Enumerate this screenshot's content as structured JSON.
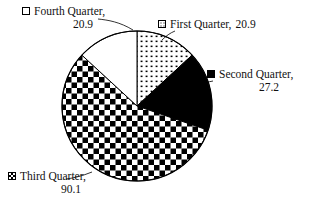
{
  "chart_data": {
    "type": "pie",
    "title": "",
    "categories": [
      "First Quarter",
      "Second Quarter",
      "Third Quarter",
      "Fourth Quarter"
    ],
    "values": [
      20.9,
      27.2,
      90.1,
      20.9
    ],
    "total": 159.1,
    "start_angle_deg": 0,
    "direction": "clockwise",
    "legend_position": "around-pie",
    "grid": false,
    "slices": [
      {
        "label": "First Quarter",
        "value": 20.9,
        "fill": "dots",
        "start_deg": 0.0,
        "end_deg": 47.3
      },
      {
        "label": "Second Quarter",
        "value": 27.2,
        "fill": "solid-black",
        "start_deg": 47.3,
        "end_deg": 108.8
      },
      {
        "label": "Third Quarter",
        "value": 90.1,
        "fill": "checker",
        "start_deg": 108.8,
        "end_deg": 312.7
      },
      {
        "label": "Fourth Quarter",
        "value": 20.9,
        "fill": "white",
        "start_deg": 312.7,
        "end_deg": 360.0
      }
    ]
  },
  "legend": {
    "first": {
      "name": "First Quarter,",
      "value": "20.9",
      "marker": "dotted-square-swatch"
    },
    "second": {
      "name": "Second Quarter,",
      "value": "27.2",
      "marker": "black-square-swatch"
    },
    "third": {
      "name": "Third Quarter,",
      "value": "90.1",
      "marker": "checker-square-swatch"
    },
    "fourth": {
      "name": "Fourth Quarter,",
      "value": "20.9",
      "marker": "white-square-swatch"
    }
  },
  "colors": {
    "ink": "#000000",
    "background": "#ffffff"
  }
}
